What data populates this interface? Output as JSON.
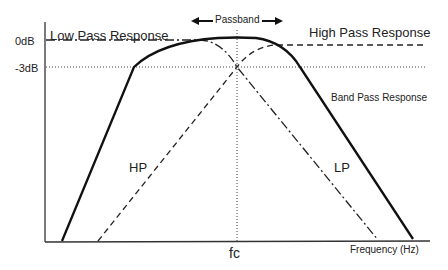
{
  "diagram": {
    "title_passband": "Passband",
    "y_labels": {
      "zero_db": "0dB",
      "minus3_db": "-3dB"
    },
    "x_labels": {
      "center": "fc",
      "axis": "Frequency  (Hz)"
    },
    "curve_labels": {
      "low_pass_response": "Low Pass Response",
      "high_pass_response": "High Pass Response",
      "band_pass_response": "Band Pass Response",
      "hp": "HP",
      "lp": "LP"
    },
    "line_styles": {
      "band_pass": "solid-thick",
      "high_pass": "dashed",
      "low_pass": "dash-dot",
      "reference": "dotted"
    },
    "colors": {
      "ink": "#222222",
      "background": "#ffffff"
    }
  }
}
